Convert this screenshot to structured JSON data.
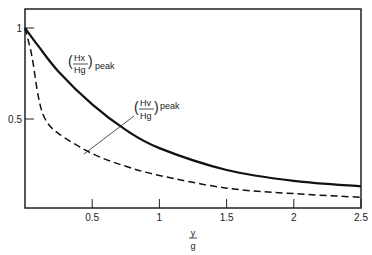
{
  "chart_data": {
    "type": "line",
    "title": "",
    "xlabel_num": "y",
    "xlabel_den": "g",
    "ylabel": "",
    "xlim": [
      0,
      2.5
    ],
    "ylim": [
      0,
      1
    ],
    "grid": false,
    "xticks": [
      "0.5",
      "1",
      "1.5",
      "2",
      "2.5"
    ],
    "yticks": [
      "0.5",
      "1"
    ],
    "series": [
      {
        "name": "(Hx/Hg)peak",
        "style": "solid",
        "x": [
          0,
          0.1,
          0.25,
          0.5,
          0.75,
          1,
          1.5,
          2,
          2.5
        ],
        "y": [
          1.0,
          0.9,
          0.76,
          0.58,
          0.44,
          0.34,
          0.22,
          0.16,
          0.13
        ]
      },
      {
        "name": "(Hv/Hg)peak",
        "style": "dashed",
        "x": [
          0,
          0.05,
          0.1,
          0.15,
          0.25,
          0.5,
          0.75,
          1,
          1.5,
          2,
          2.5
        ],
        "y": [
          1.0,
          0.85,
          0.62,
          0.5,
          0.42,
          0.31,
          0.24,
          0.19,
          0.12,
          0.09,
          0.07
        ]
      }
    ],
    "annotations": [
      {
        "label_num": "Hx",
        "label_den": "Hg",
        "suffix": "peak"
      },
      {
        "label_num": "Hv",
        "label_den": "Hg",
        "suffix": "peak"
      }
    ]
  }
}
